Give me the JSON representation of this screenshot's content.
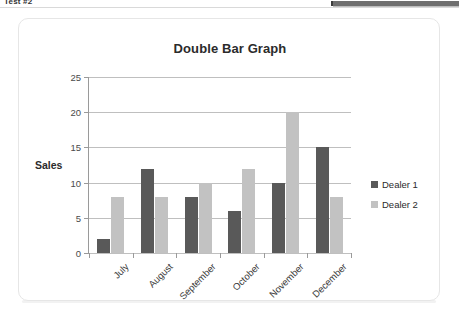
{
  "browser_chrome": {
    "tab_label": "Test #2",
    "right_bar_name": "toolbar-strip"
  },
  "chart_data": {
    "type": "bar",
    "title": "Double Bar Graph",
    "xlabel": "",
    "ylabel": "Sales",
    "categories": [
      "July",
      "August",
      "September",
      "October",
      "November",
      "December"
    ],
    "series": [
      {
        "name": "Dealer 1",
        "color": "#595959",
        "values": [
          2,
          12,
          8,
          6,
          10,
          15
        ]
      },
      {
        "name": "Dealer 2",
        "color": "#c2c2c2",
        "values": [
          8,
          8,
          10,
          12,
          20,
          8
        ]
      }
    ],
    "ylim": [
      0,
      25
    ],
    "yticks": [
      0,
      5,
      10,
      15,
      20,
      25
    ],
    "grid": true,
    "legend_position": "right"
  }
}
